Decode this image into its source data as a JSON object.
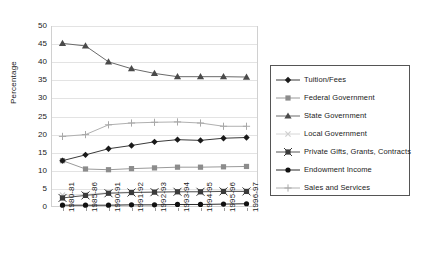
{
  "chart_data": {
    "type": "line",
    "title": "",
    "xlabel": "",
    "ylabel": "Percentage",
    "ylim": [
      0,
      50
    ],
    "ytick_step": 5,
    "grid": true,
    "legend_position": "right",
    "categories": [
      "1980-81",
      "1985-86",
      "1990-91",
      "1991-92",
      "1992-93",
      "1993-94",
      "1994-95",
      "1995-96",
      "1996-97"
    ],
    "ytick_labels": [
      "0",
      "5",
      "10",
      "15",
      "20",
      "25",
      "30",
      "35",
      "40",
      "45",
      "50"
    ],
    "series": [
      {
        "name": "Tuition/Fees",
        "marker": "diamond",
        "color": "#1a1a1a",
        "line_color": "#3a3a3a",
        "values": [
          12.8,
          14.4,
          16.1,
          17.0,
          18.0,
          18.6,
          18.4,
          19.0,
          19.2
        ]
      },
      {
        "name": "Federal Government",
        "marker": "square",
        "color": "#8c8c8c",
        "line_color": "#9a9a9a",
        "values": [
          12.8,
          10.5,
          10.3,
          10.6,
          10.8,
          11.0,
          11.0,
          11.1,
          11.2
        ]
      },
      {
        "name": "State Government",
        "marker": "triangle",
        "color": "#4a4a4a",
        "line_color": "#6a6a6a",
        "values": [
          45.2,
          44.5,
          40.1,
          38.2,
          36.9,
          36.0,
          36.0,
          36.0,
          35.9
        ]
      },
      {
        "name": "Local Government",
        "marker": "cross-x",
        "color": "#cfcfcf",
        "line_color": "#d6d6d6",
        "values": [
          3.3,
          3.4,
          4.0,
          4.1,
          4.2,
          4.3,
          4.3,
          4.4,
          4.4
        ]
      },
      {
        "name": "Private Gifts, Grants, Contracts",
        "marker": "square-x",
        "color": "#3a3a3a",
        "line_color": "#555555",
        "values": [
          2.5,
          3.2,
          3.8,
          4.0,
          4.1,
          4.2,
          4.2,
          4.3,
          4.3
        ]
      },
      {
        "name": "Endowment Income",
        "marker": "circle",
        "color": "#101010",
        "line_color": "#2a2a2a",
        "values": [
          0.5,
          0.5,
          0.5,
          0.6,
          0.6,
          0.7,
          0.7,
          0.8,
          0.9
        ]
      },
      {
        "name": "Sales and Services",
        "marker": "plus",
        "color": "#a8a8a8",
        "line_color": "#b0b0b0",
        "values": [
          19.5,
          20.0,
          22.7,
          23.2,
          23.4,
          23.5,
          23.2,
          22.3,
          22.3
        ]
      }
    ]
  }
}
